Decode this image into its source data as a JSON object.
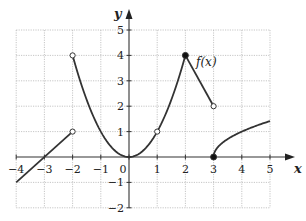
{
  "chart_data": {
    "type": "line",
    "title": "",
    "xlabel": "x",
    "ylabel": "y",
    "xlim": [
      -4,
      5
    ],
    "ylim": [
      -2,
      5
    ],
    "grid": true,
    "x_ticks": [
      "-4",
      "-3",
      "-2",
      "-1",
      "0",
      "1",
      "2",
      "3",
      "4",
      "5"
    ],
    "y_ticks": [
      "-2",
      "-1",
      "1",
      "2",
      "3",
      "4",
      "5"
    ],
    "function_label": "f(x)",
    "pieces": [
      {
        "name": "linear-left",
        "kind": "line",
        "points": [
          [
            -4,
            -1
          ],
          [
            -2,
            1
          ]
        ],
        "left_endpoint": "none",
        "right_endpoint": "open"
      },
      {
        "name": "parabola",
        "kind": "curve",
        "formula": "y = x^2",
        "domain": [
          -2,
          2
        ],
        "left_endpoint": "open",
        "right_endpoint": "closed"
      },
      {
        "name": "linear-right",
        "kind": "line",
        "points": [
          [
            2,
            4
          ],
          [
            3,
            2
          ]
        ],
        "left_endpoint": "closed",
        "right_endpoint": "open"
      },
      {
        "name": "sqrt",
        "kind": "curve",
        "formula": "y = sqrt(x - 3)",
        "domain": [
          3,
          5
        ],
        "left_endpoint": "closed",
        "right_endpoint": "none"
      }
    ],
    "marked_points": [
      {
        "x": -2,
        "y": 1,
        "style": "open"
      },
      {
        "x": -2,
        "y": 4,
        "style": "open"
      },
      {
        "x": 1,
        "y": 1,
        "style": "open"
      },
      {
        "x": 0,
        "y": 0,
        "style": "none"
      },
      {
        "x": 2,
        "y": 4,
        "style": "closed"
      },
      {
        "x": 3,
        "y": 2,
        "style": "open"
      },
      {
        "x": 3,
        "y": 0,
        "style": "closed"
      }
    ]
  },
  "labels": {
    "x_axis": "x",
    "y_axis": "y",
    "function": "f(x)",
    "origin": "0"
  }
}
